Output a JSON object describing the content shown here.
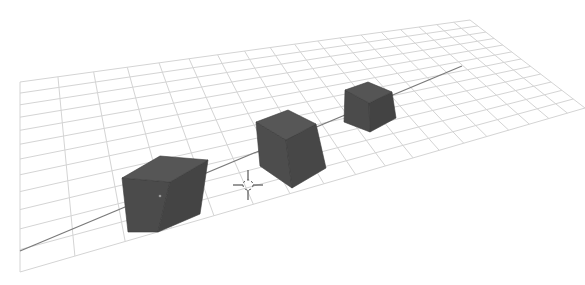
{
  "viewport": {
    "type": "3d-viewport",
    "background": "#ffffff",
    "grid": {
      "color": "#d4d4d4",
      "corners": {
        "far_left": [
          20,
          82
        ],
        "far_right": [
          470,
          20
        ],
        "near_right": [
          585,
          108
        ],
        "near_left": [
          20,
          272
        ]
      },
      "rows": 12,
      "cols": 18
    },
    "x_axis": {
      "color": "#7a7a7a",
      "from": [
        20,
        251
      ],
      "to": [
        462,
        66
      ]
    },
    "cursor_3d": {
      "name": "3d-cursor",
      "center": [
        248,
        185
      ],
      "color": "#555555"
    },
    "objects": [
      {
        "name": "Cube",
        "label": "cube-near",
        "top": [
          [
            122,
            178
          ],
          [
            160,
            156
          ],
          [
            208,
            160
          ],
          [
            170,
            182
          ]
        ],
        "front": [
          [
            122,
            178
          ],
          [
            170,
            182
          ],
          [
            158,
            232
          ],
          [
            128,
            232
          ]
        ],
        "side": [
          [
            170,
            182
          ],
          [
            208,
            160
          ],
          [
            200,
            214
          ],
          [
            158,
            232
          ]
        ],
        "colors": {
          "top": "#565656",
          "front": "#4b4b4b",
          "side": "#444444"
        },
        "origin_dot": [
          160,
          196
        ]
      },
      {
        "name": "Cube.001",
        "label": "cube-middle",
        "top": [
          [
            256,
            122
          ],
          [
            288,
            110
          ],
          [
            316,
            124
          ],
          [
            286,
            140
          ]
        ],
        "front": [
          [
            256,
            122
          ],
          [
            286,
            140
          ],
          [
            292,
            188
          ],
          [
            260,
            166
          ]
        ],
        "side": [
          [
            286,
            140
          ],
          [
            316,
            124
          ],
          [
            326,
            168
          ],
          [
            292,
            188
          ]
        ],
        "colors": {
          "top": "#575757",
          "front": "#4d4d4d",
          "side": "#474747"
        },
        "origin_dot": null
      },
      {
        "name": "Cube.002",
        "label": "cube-far",
        "top": [
          [
            345,
            90
          ],
          [
            368,
            82
          ],
          [
            392,
            92
          ],
          [
            369,
            103
          ]
        ],
        "front": [
          [
            345,
            90
          ],
          [
            369,
            103
          ],
          [
            370,
            132
          ],
          [
            344,
            122
          ]
        ],
        "side": [
          [
            369,
            103
          ],
          [
            392,
            92
          ],
          [
            396,
            118
          ],
          [
            370,
            132
          ]
        ],
        "colors": {
          "top": "#555555",
          "front": "#4b4b4b",
          "side": "#434343"
        },
        "origin_dot": null
      }
    ]
  }
}
